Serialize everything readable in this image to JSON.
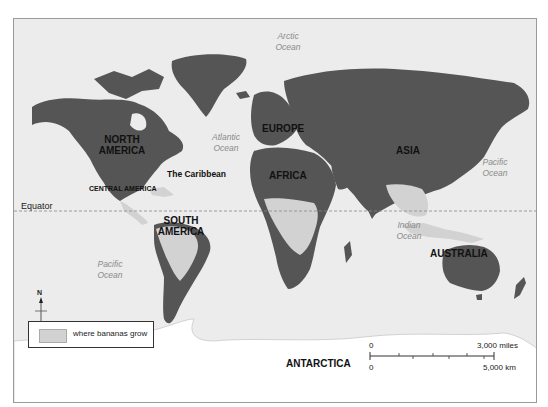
{
  "map": {
    "type": "world-map",
    "colors": {
      "ocean": "#ececec",
      "land": "#555555",
      "banana_regions": "#d2d2d2",
      "antarctica": "#ffffff",
      "frame": "#9a9a9a"
    },
    "continents": {
      "north_america": "NORTH AMERICA",
      "south_america": "SOUTH AMERICA",
      "europe": "EUROPE",
      "africa": "AFRICA",
      "asia": "ASIA",
      "australia": "AUSTRALIA",
      "antarctica": "ANTARCTICA"
    },
    "regions": {
      "caribbean": "The Caribbean",
      "central_america": "CENTRAL AMERICA"
    },
    "oceans": {
      "arctic": "Arctic Ocean",
      "atlantic": "Atlantic Ocean",
      "pacific_east": "Pacific Ocean",
      "pacific_west": "Pacific Ocean",
      "indian": "Indian Ocean"
    },
    "equator_label": "Equator",
    "compass": {
      "north": "N"
    },
    "legend": {
      "items": [
        {
          "label": "where bananas grow",
          "color": "#d2d2d2"
        }
      ]
    },
    "scale": {
      "miles_zero": "0",
      "miles_max": "3,000 miles",
      "km_zero": "0",
      "km_max": "5,000 km"
    }
  }
}
